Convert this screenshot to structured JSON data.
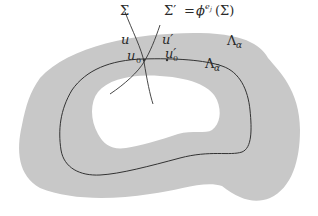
{
  "diagram": {
    "colors": {
      "region_fill": "#c8c8c8",
      "hole_fill": "#ffffff",
      "stroke": "#333333"
    },
    "labels": {
      "sigma": "Σ",
      "sigma_prime_lhs": "Σ′",
      "equals": "=",
      "phi": "ϕ",
      "exponent": "e",
      "exponent_sub": "j",
      "sigma_arg": "(Σ)",
      "u": "u",
      "u_prime": "u′",
      "u0": "u",
      "u0_sub": "0",
      "u0_prime": "u′",
      "u0_prime_sub": "0",
      "lambda_alpha": "Λ",
      "lambda_alpha_sub": "α",
      "lambda_alpha_bar": "Λ",
      "lambda_alpha_bar_sub": "ᾱ"
    }
  }
}
